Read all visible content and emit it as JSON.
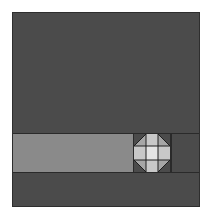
{
  "game": {
    "type": "sliding-block-puzzle",
    "board": {
      "background_color": "#4b4b4b",
      "border_color": "#2e2e2e"
    },
    "track": {
      "fill_color": "#8a8a8a",
      "line_color": "#2a2a2a"
    },
    "piece": {
      "shape": "octagon",
      "grid": "3x3",
      "corner_color": "#9e9e9e",
      "edge_color": "#c8c8c8",
      "center_color": "#e4e4e4",
      "line_color": "#1e1e1e"
    }
  }
}
